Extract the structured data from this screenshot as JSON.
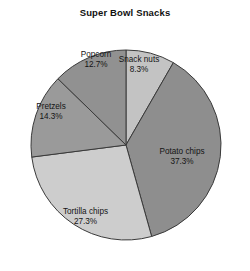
{
  "chart_data": {
    "type": "pie",
    "title": "Super Bowl Snacks",
    "xlabel": "",
    "ylabel": "",
    "unit": "percent",
    "start_angle_deg": 0,
    "direction": "clockwise",
    "legend": "none",
    "grid": false,
    "categories": [
      "Snack nuts",
      "Potato chips",
      "Tortilla chips",
      "Pretzels",
      "Popcorn"
    ],
    "values": [
      8.3,
      37.3,
      27.3,
      14.3,
      12.7
    ],
    "value_labels": [
      "8.3%",
      "37.3%",
      "27.3%",
      "14.3%",
      "12.7%"
    ],
    "colors": [
      "#c3c3c3",
      "#8e8e8e",
      "#cdcdcd",
      "#9a9a9a",
      "#919191"
    ],
    "slices": [
      {
        "name": "Snack nuts",
        "value": 8.3,
        "value_label": "8.3%",
        "color": "#c3c3c3",
        "label_x_pct": 55.6,
        "label_y_pct": 24.0
      },
      {
        "name": "Potato chips",
        "value": 37.3,
        "value_label": "37.3%",
        "color": "#8e8e8e",
        "label_x_pct": 72.8,
        "label_y_pct": 58.0
      },
      {
        "name": "Tortilla chips",
        "value": 27.3,
        "value_label": "27.3%",
        "color": "#cdcdcd",
        "label_x_pct": 34.2,
        "label_y_pct": 80.0
      },
      {
        "name": "Pretzels",
        "value": 14.3,
        "value_label": "14.3%",
        "color": "#9a9a9a",
        "label_x_pct": 20.4,
        "label_y_pct": 41.4
      },
      {
        "name": "Popcorn",
        "value": 12.7,
        "value_label": "12.7%",
        "color": "#919191",
        "label_x_pct": 38.4,
        "label_y_pct": 22.0
      }
    ],
    "geometry": {
      "center_x": 126,
      "center_y": 145,
      "radius": 95
    }
  }
}
